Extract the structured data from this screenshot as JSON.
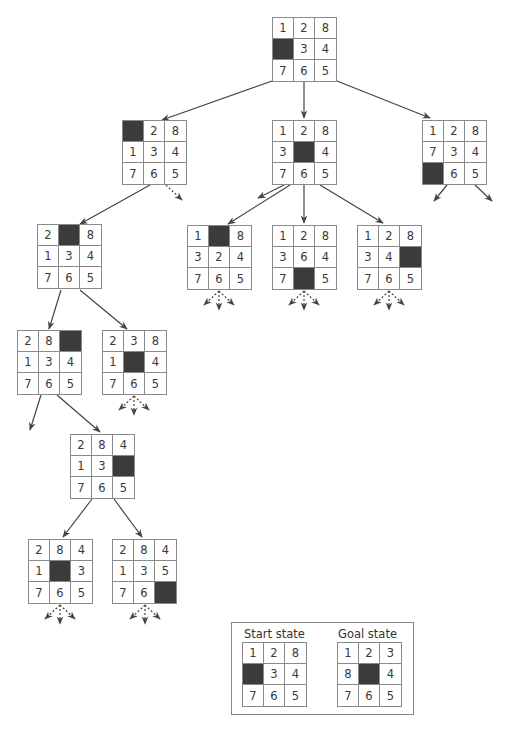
{
  "colors": {
    "blank": "#3b3b3b",
    "grid": "#8a8a8a",
    "text": "#3a3a3a",
    "edge": "#444444"
  },
  "nodes": [
    {
      "id": "root",
      "x": 272,
      "y": 17,
      "tiles": [
        "1",
        "2",
        "8",
        "",
        "3",
        "4",
        "7",
        "6",
        "5"
      ]
    },
    {
      "id": "l2a",
      "x": 122,
      "y": 120,
      "tiles": [
        "",
        "2",
        "8",
        "1",
        "3",
        "4",
        "7",
        "6",
        "5"
      ]
    },
    {
      "id": "l2b",
      "x": 272,
      "y": 120,
      "tiles": [
        "1",
        "2",
        "8",
        "3",
        "",
        "4",
        "7",
        "6",
        "5"
      ]
    },
    {
      "id": "l2c",
      "x": 422,
      "y": 120,
      "tiles": [
        "1",
        "2",
        "8",
        "7",
        "3",
        "4",
        "",
        "6",
        "5"
      ]
    },
    {
      "id": "l3a",
      "x": 37,
      "y": 224,
      "tiles": [
        "2",
        "",
        "8",
        "1",
        "3",
        "4",
        "7",
        "6",
        "5"
      ]
    },
    {
      "id": "l3b",
      "x": 187,
      "y": 225,
      "tiles": [
        "1",
        "",
        "8",
        "3",
        "2",
        "4",
        "7",
        "6",
        "5"
      ]
    },
    {
      "id": "l3c",
      "x": 272,
      "y": 225,
      "tiles": [
        "1",
        "2",
        "8",
        "3",
        "6",
        "4",
        "7",
        "",
        "5"
      ]
    },
    {
      "id": "l3d",
      "x": 357,
      "y": 225,
      "tiles": [
        "1",
        "2",
        "8",
        "3",
        "4",
        "",
        "7",
        "6",
        "5"
      ]
    },
    {
      "id": "l4a",
      "x": 17,
      "y": 330,
      "tiles": [
        "2",
        "8",
        "",
        "1",
        "3",
        "4",
        "7",
        "6",
        "5"
      ]
    },
    {
      "id": "l4b",
      "x": 102,
      "y": 330,
      "tiles": [
        "2",
        "3",
        "8",
        "1",
        "",
        "4",
        "7",
        "6",
        "5"
      ]
    },
    {
      "id": "l5a",
      "x": 70,
      "y": 434,
      "tiles": [
        "2",
        "8",
        "4",
        "1",
        "3",
        "",
        "7",
        "6",
        "5"
      ]
    },
    {
      "id": "l6a",
      "x": 28,
      "y": 539,
      "tiles": [
        "2",
        "8",
        "4",
        "1",
        "",
        "3",
        "7",
        "6",
        "5"
      ]
    },
    {
      "id": "l6b",
      "x": 112,
      "y": 539,
      "tiles": [
        "2",
        "8",
        "4",
        "1",
        "3",
        "5",
        "7",
        "6",
        ""
      ]
    }
  ],
  "edges": [
    {
      "from": [
        272,
        81
      ],
      "to": [
        162,
        120
      ],
      "style": "solid"
    },
    {
      "from": [
        304,
        81
      ],
      "to": [
        304,
        118
      ],
      "style": "solid"
    },
    {
      "from": [
        337,
        81
      ],
      "to": [
        430,
        118
      ],
      "style": "solid"
    },
    {
      "from": [
        150,
        185
      ],
      "to": [
        80,
        224
      ],
      "style": "solid"
    },
    {
      "from": [
        166,
        185
      ],
      "to": [
        182,
        200
      ],
      "style": "dashed"
    },
    {
      "from": [
        284,
        185
      ],
      "to": [
        258,
        198
      ],
      "style": "solid"
    },
    {
      "from": [
        290,
        185
      ],
      "to": [
        228,
        224
      ],
      "style": "solid"
    },
    {
      "from": [
        304,
        185
      ],
      "to": [
        304,
        223
      ],
      "style": "solid"
    },
    {
      "from": [
        320,
        185
      ],
      "to": [
        383,
        223
      ],
      "style": "solid"
    },
    {
      "from": [
        447,
        185
      ],
      "to": [
        434,
        201
      ],
      "style": "solid"
    },
    {
      "from": [
        475,
        185
      ],
      "to": [
        492,
        201
      ],
      "style": "solid"
    },
    {
      "from": [
        61,
        290
      ],
      "to": [
        49,
        329
      ],
      "style": "solid"
    },
    {
      "from": [
        80,
        290
      ],
      "to": [
        127,
        329
      ],
      "style": "solid"
    },
    {
      "from": [
        41,
        395
      ],
      "to": [
        30,
        430
      ],
      "style": "solid"
    },
    {
      "from": [
        57,
        395
      ],
      "to": [
        100,
        432
      ],
      "style": "solid"
    },
    {
      "from": [
        92,
        499
      ],
      "to": [
        63,
        537
      ],
      "style": "solid"
    },
    {
      "from": [
        114,
        499
      ],
      "to": [
        142,
        537
      ],
      "style": "solid"
    }
  ],
  "dashed_fans": [
    {
      "cx": 219,
      "cy": 291
    },
    {
      "cx": 304,
      "cy": 291
    },
    {
      "cx": 389,
      "cy": 291
    },
    {
      "cx": 134,
      "cy": 396
    },
    {
      "cx": 60,
      "cy": 605
    },
    {
      "cx": 145,
      "cy": 605
    }
  ],
  "legend": {
    "start_label": "Start state",
    "goal_label": "Goal state",
    "start": {
      "x": 242,
      "y": 642,
      "tiles": [
        "1",
        "2",
        "8",
        "",
        "3",
        "4",
        "7",
        "6",
        "5"
      ]
    },
    "goal": {
      "x": 337,
      "y": 642,
      "tiles": [
        "1",
        "2",
        "3",
        "8",
        "",
        "4",
        "7",
        "6",
        "5"
      ]
    }
  }
}
